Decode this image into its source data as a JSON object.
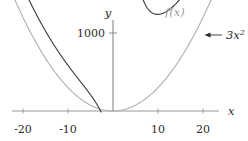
{
  "figure": {
    "background": "#ffffff",
    "axis_color": "#8d8d8d",
    "curve_color_f": "#3a3a3a",
    "curve_color_g": "#a8a8a8",
    "annotation_color": "#2b2b2b"
  },
  "labels": {
    "y_axis": "y",
    "x_axis": "x",
    "y_tick_1000": "1000",
    "curve_f_label": "f(x)",
    "curve_g_label_base": "3x",
    "curve_g_label_exp": "2",
    "arrow": "left-arrow"
  },
  "chart_data": {
    "type": "line",
    "title": "",
    "xlabel": "x",
    "ylabel": "y",
    "xlim": [
      -22.5,
      22.5
    ],
    "ylim": [
      0,
      1450
    ],
    "grid": false,
    "legend": "inline-annotations",
    "xticks": [
      -20,
      -10,
      10,
      20
    ],
    "xtick_labels": [
      "-20",
      "-10",
      "10",
      "20"
    ],
    "yticks": [
      1000
    ],
    "ytick_labels": [
      "1000"
    ],
    "annotations": [
      {
        "text": "f(x)",
        "target_series": "f(x)",
        "x": 16.5,
        "y": 1330,
        "color": "#9a9a9a"
      },
      {
        "text": "3x^2",
        "target_series": "3x^2",
        "x": 21.5,
        "y": 1120,
        "color": "#2b2b2b",
        "arrow": true
      }
    ],
    "series": [
      {
        "name": "f(x)",
        "color": "#3a3a3a",
        "description": "rational-type curve asymptotic to 3x^2, with vertical asymptote near x = 2.8",
        "vertical_asymptote": 2.8,
        "local_minimum": {
          "x": 5.4,
          "y": 160
        },
        "x": [
          -21.5,
          -20,
          -18,
          -16,
          -14,
          -12,
          -10,
          -8,
          -6,
          -4,
          -2,
          -1,
          -0.2,
          0,
          1,
          2,
          2.5,
          2.75,
          2.85,
          3.2,
          3.6,
          4.2,
          5.0,
          5.4,
          6.2,
          7.5,
          9,
          11,
          13,
          15,
          17,
          19,
          20.5
        ],
        "y": [
          1450,
          1270,
          1040,
          830,
          640,
          470,
          330,
          215,
          125,
          60,
          18,
          6,
          1,
          0,
          5,
          60,
          230,
          700,
          1450,
          640,
          370,
          230,
          172,
          160,
          172,
          235,
          340,
          520,
          730,
          970,
          1230,
          1450,
          1450
        ]
      },
      {
        "name": "3x^2",
        "color": "#a8a8a8",
        "description": "parabola y = 3x^2",
        "x": [
          -22,
          -20,
          -18,
          -16,
          -14,
          -12,
          -10,
          -8,
          -6,
          -4,
          -2,
          0,
          2,
          4,
          6,
          8,
          10,
          12,
          14,
          16,
          18,
          20,
          22
        ],
        "y": [
          1452,
          1200,
          972,
          768,
          588,
          432,
          300,
          192,
          108,
          48,
          12,
          0,
          12,
          48,
          108,
          192,
          300,
          432,
          588,
          768,
          972,
          1200,
          1452
        ]
      }
    ]
  }
}
